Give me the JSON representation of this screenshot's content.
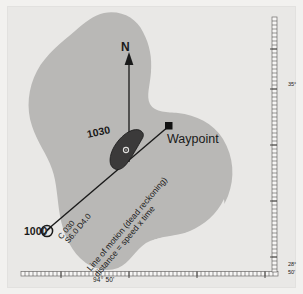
{
  "chart": {
    "background_color": "#f2f1ef",
    "sea_color": "#e9e8e6",
    "land_color": "#b9b8b6",
    "ink_color": "#1a1a1a"
  },
  "compass": {
    "north_label": "N"
  },
  "waypoint": {
    "label": "Waypoint",
    "marker": "square-marker"
  },
  "fixes": [
    {
      "time": "1000",
      "marker": "circle-fix-marker",
      "name": "departure-fix"
    },
    {
      "time": "1030",
      "marker": "vessel-icon",
      "name": "dr-position"
    }
  ],
  "annotations": {
    "course": "C 030",
    "speed_distance": "S6.0 D4.0",
    "line_of_motion": "Line of motion (dead reckoning)",
    "dr_formula": "distance = speed x time"
  },
  "graticule": {
    "longitude_label": "94° 50'",
    "latitude_mid_label": "35°",
    "latitude_low_label": "28°",
    "latitude_bottom_label": "50'"
  }
}
